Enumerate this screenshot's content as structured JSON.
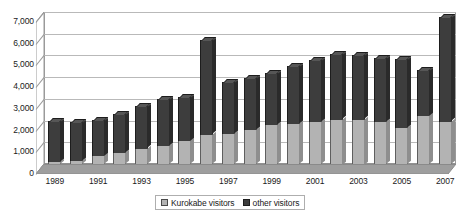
{
  "chart_data": {
    "type": "bar",
    "title": "",
    "subtitle": "",
    "xlabel": "",
    "ylabel": "",
    "stacked": true,
    "grid": true,
    "legend_position": "bottom",
    "ylim": [
      0,
      7000
    ],
    "ytick_values": [
      0,
      1000,
      2000,
      3000,
      4000,
      5000,
      6000,
      7000
    ],
    "ytick_labels": [
      "0",
      "1,000",
      "2,000",
      "3,000",
      "4,000",
      "5,000",
      "6,000",
      "7,000"
    ],
    "categories": [
      "1989",
      "1990",
      "1991",
      "1992",
      "1993",
      "1994",
      "1995",
      "1996",
      "1997",
      "1998",
      "1999",
      "2000",
      "2001",
      "2002",
      "2003",
      "2004",
      "2005",
      "2006",
      "2007"
    ],
    "xtick_labels_shown": [
      "1989",
      "1991",
      "1993",
      "1995",
      "1997",
      "1999",
      "2001",
      "2003",
      "2005",
      "2007"
    ],
    "series": [
      {
        "name": "Kurokabe visitors",
        "color": "#b3b3b3",
        "values": [
          100,
          150,
          350,
          500,
          700,
          850,
          1050,
          1350,
          1400,
          1550,
          1800,
          1850,
          1950,
          2050,
          2050,
          1950,
          1650,
          2200,
          1950
        ]
      },
      {
        "name": "other visitors",
        "color": "#3d3d3d",
        "values": [
          1900,
          1800,
          1700,
          1800,
          1950,
          2150,
          2050,
          4350,
          2400,
          2400,
          2400,
          2650,
          2850,
          3000,
          2950,
          2950,
          3200,
          2150,
          4800
        ]
      }
    ],
    "totals": [
      2000,
      1950,
      2050,
      2300,
      2650,
      3000,
      3100,
      5700,
      3800,
      3950,
      4200,
      4500,
      4800,
      5050,
      5000,
      4900,
      4850,
      4350,
      6750
    ]
  },
  "legend": {
    "items": [
      {
        "label": "Kurokabe visitors",
        "swatch": "kurokabe-swatch"
      },
      {
        "label": "other visitors",
        "swatch": "other-swatch"
      }
    ]
  },
  "colors": {
    "series_kurokabe": "#b3b3b3",
    "series_other": "#3d3d3d",
    "gridline": "#b9b9b9",
    "axis": "#8a8a8a",
    "floor": "#9e9e9e",
    "background": "#ffffff",
    "text": "#1a1a1a"
  }
}
